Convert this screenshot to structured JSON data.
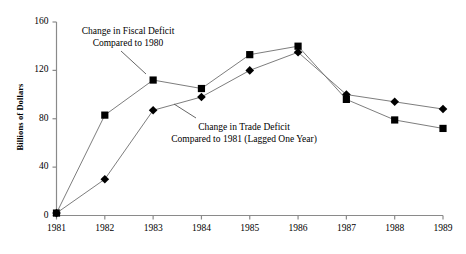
{
  "chart_data": {
    "type": "line",
    "title": "",
    "xlabel": "",
    "ylabel": "Billions of Dollars",
    "x": [
      "1981",
      "1982",
      "1983",
      "1984",
      "1985",
      "1986",
      "1987",
      "1988",
      "1989"
    ],
    "categories": [
      "1981",
      "1982",
      "1983",
      "1984",
      "1985",
      "1986",
      "1987",
      "1988",
      "1989"
    ],
    "ylim": [
      0,
      160
    ],
    "yticks": [
      0,
      40,
      80,
      120,
      160
    ],
    "ytick_labels": [
      "0",
      "40",
      "80",
      "120",
      "160"
    ],
    "xtick_labels": [
      "1981",
      "1982",
      "1983",
      "1984",
      "1985",
      "1986",
      "1987",
      "1988",
      "1989"
    ],
    "grid": false,
    "legend": "none",
    "series": [
      {
        "name": "Change in Fiscal Deficit Compared to 1980",
        "marker": "square",
        "color": "#000000",
        "values": [
          2,
          83,
          112,
          105,
          133,
          140,
          96,
          79,
          72
        ]
      },
      {
        "name": "Change in Trade Deficit Compared to 1981 (Lagged One Year)",
        "marker": "diamond",
        "color": "#000000",
        "values": [
          2,
          30,
          87,
          98,
          120,
          135,
          100,
          94,
          88
        ]
      }
    ],
    "annotations": [
      {
        "id": "fiscal",
        "line1": "Change in Fiscal Deficit",
        "line2": "Compared to 1980",
        "leader_to": "1983"
      },
      {
        "id": "trade",
        "line1": "Change in Trade Deficit",
        "line2": "Compared to 1981 (Lagged One Year)",
        "leader_to": "1984"
      }
    ]
  },
  "axes": {
    "y_title": "Billions of Dollars"
  }
}
